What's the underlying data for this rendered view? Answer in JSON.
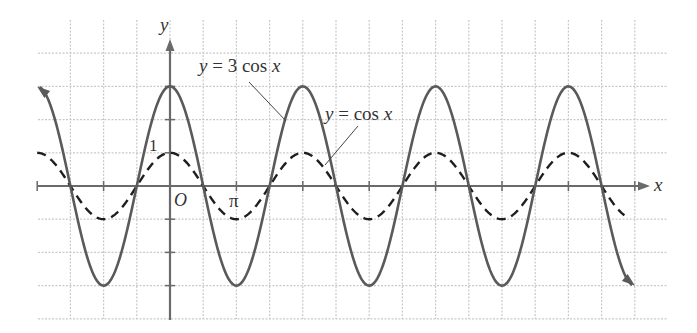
{
  "chart_data": {
    "type": "line",
    "title": "",
    "xlabel": "x",
    "ylabel": "y",
    "x_tick_labels": [
      {
        "label": "O",
        "value": 0
      },
      {
        "label": "π",
        "value": 3.14159
      }
    ],
    "y_tick_labels": [
      {
        "label": "1",
        "value": 1
      }
    ],
    "xlim": [
      -6.2832,
      21.9911
    ],
    "ylim": [
      -4,
      4
    ],
    "grid": true,
    "grid_step_x": "π/2",
    "grid_step_y": 1,
    "series": [
      {
        "name": "y = 3 cos x",
        "style": "solid",
        "amplitude": 3,
        "x": [
          -6.2832,
          -3.1416,
          0,
          3.1416,
          6.2832,
          9.4248,
          12.5664,
          15.708,
          18.8496,
          21.9911
        ],
        "values": [
          3,
          -3,
          3,
          -3,
          3,
          -3,
          3,
          -3,
          3,
          -3
        ],
        "arrows": "both"
      },
      {
        "name": "y = cos x",
        "style": "dashed",
        "amplitude": 1,
        "x": [
          -6.2832,
          -3.1416,
          0,
          3.1416,
          6.2832,
          9.4248,
          12.5664,
          15.708,
          18.8496,
          21.5
        ],
        "values": [
          1,
          -1,
          1,
          -1,
          1,
          -1,
          1,
          -1,
          1,
          -0.95
        ]
      }
    ],
    "annotations": [
      {
        "text": "y = 3 cos x",
        "points_to": "solid curve"
      },
      {
        "text": "y = cos x",
        "points_to": "dashed curve"
      }
    ]
  },
  "labels": {
    "y_axis": "y",
    "x_axis": "x",
    "origin": "O",
    "pi": "π",
    "one": "1",
    "solid_label_y": "y",
    "solid_label_rest": " = 3 cos ",
    "solid_label_x": "x",
    "dashed_label_y": "y",
    "dashed_label_rest": " = cos ",
    "dashed_label_x": "x"
  },
  "colors": {
    "grid": "#c9c9c9",
    "axis": "#6a6a6a",
    "solid_curve": "#5a5a5a",
    "dashed_curve": "#1e1e1e"
  }
}
